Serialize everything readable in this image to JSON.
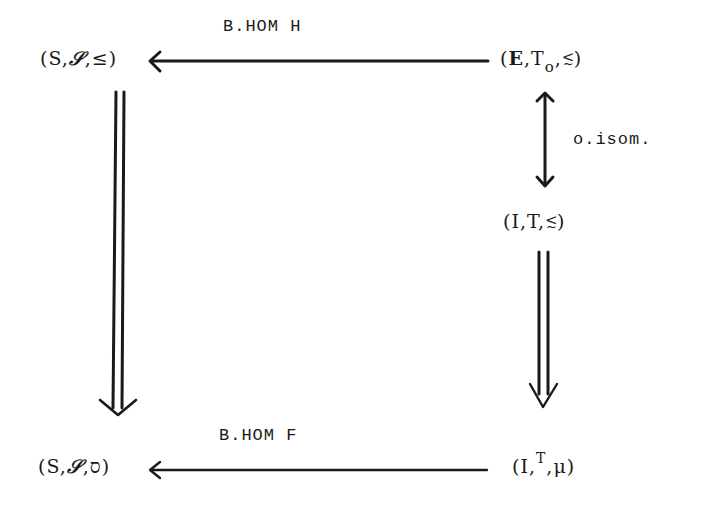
{
  "diagram": {
    "type": "commutative-diagram",
    "nodes": {
      "top_left": {
        "open": "(",
        "a": "S",
        "b": "𝒮",
        "c": "≤",
        "close": ")"
      },
      "top_right": {
        "open": "(",
        "a": "E",
        "b": "T",
        "b_sub": "o",
        "c_top": "<",
        "c_bot": "~",
        "close": ")"
      },
      "mid_right": {
        "open": "(",
        "a": "I",
        "b": "T",
        "c_top": "<",
        "c_bot": "~",
        "close": ")"
      },
      "bottom_left": {
        "open": "(",
        "a": "S",
        "b": "𝒮",
        "c": "ס",
        "close": ")"
      },
      "bottom_right": {
        "open": "(",
        "a": "I",
        "b": "T",
        "c": "μ",
        "close": ")"
      }
    },
    "separator": ",",
    "edges": [
      {
        "from": "top_right",
        "to": "top_left",
        "label": "B.HOM H",
        "style": "single-arrow"
      },
      {
        "from": "top_right",
        "to": "mid_right",
        "label": "o.isom.",
        "style": "double-headed-arrow"
      },
      {
        "from": "top_left",
        "to": "bottom_left",
        "label": "",
        "style": "double-line-arrow"
      },
      {
        "from": "mid_right",
        "to": "bottom_right",
        "label": "",
        "style": "double-line-arrow"
      },
      {
        "from": "bottom_right",
        "to": "bottom_left",
        "label": "B.HOM F",
        "style": "single-arrow"
      }
    ]
  }
}
